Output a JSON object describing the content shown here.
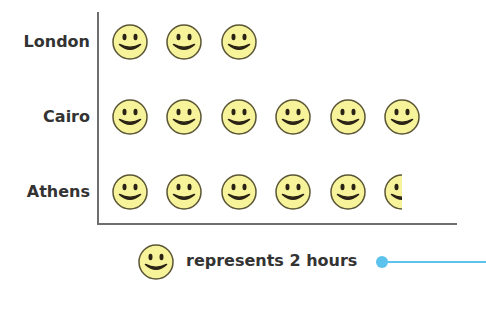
{
  "chart_data": {
    "type": "pictogram",
    "title": "",
    "categories": [
      "London",
      "Cairo",
      "Athens"
    ],
    "symbols": [
      3,
      6,
      5.5
    ],
    "values": [
      6,
      12,
      11
    ],
    "unit": "hours",
    "key": {
      "symbol": "smiley-face",
      "represents": 2,
      "label": "represents 2 hours"
    },
    "colors": {
      "face_fill": "#f7f39a",
      "face_stroke": "#5a5535",
      "features": "#2a2315",
      "axis": "#6e6e6e",
      "pointer": "#5cc3ee"
    }
  },
  "rows": [
    {
      "label": "London",
      "count": 3
    },
    {
      "label": "Cairo",
      "count": 6
    },
    {
      "label": "Athens",
      "count": 5.5
    }
  ],
  "legend": {
    "text": "represents 2 hours"
  }
}
